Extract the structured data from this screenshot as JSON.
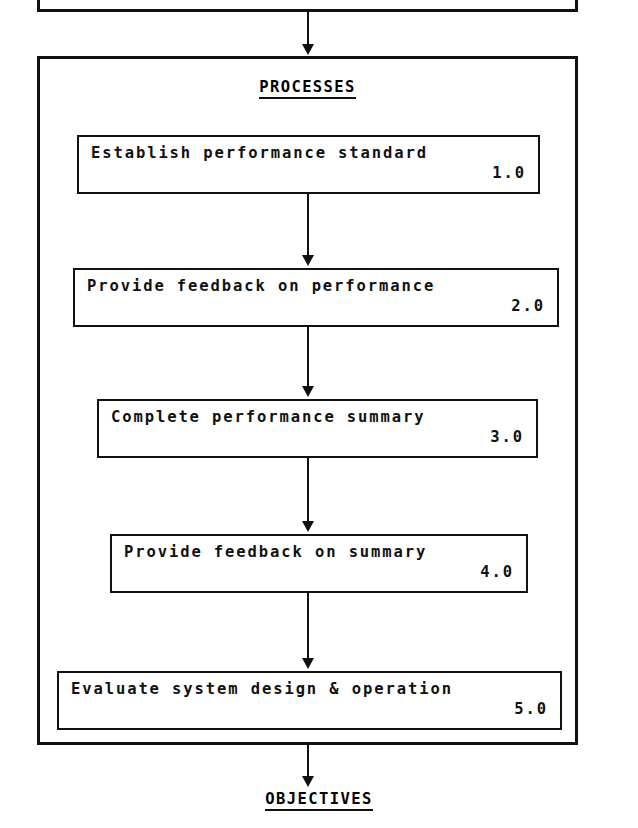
{
  "diagram": {
    "top_box": {
      "text": "clipped partial box (text cut off above frame)"
    },
    "processes_section": {
      "header": "PROCESSES",
      "steps": [
        {
          "label": "Establish performance standard",
          "number": "1.0"
        },
        {
          "label": "Provide feedback on performance",
          "number": "2.0"
        },
        {
          "label": "Complete performance summary",
          "number": "3.0"
        },
        {
          "label": "Provide feedback on summary",
          "number": "4.0"
        },
        {
          "label": "Evaluate system design & operation",
          "number": "5.0"
        }
      ]
    },
    "footer": {
      "label": "OBJECTIVES"
    },
    "colors": {
      "ink": "#111111",
      "paper": "#ffffff"
    }
  }
}
